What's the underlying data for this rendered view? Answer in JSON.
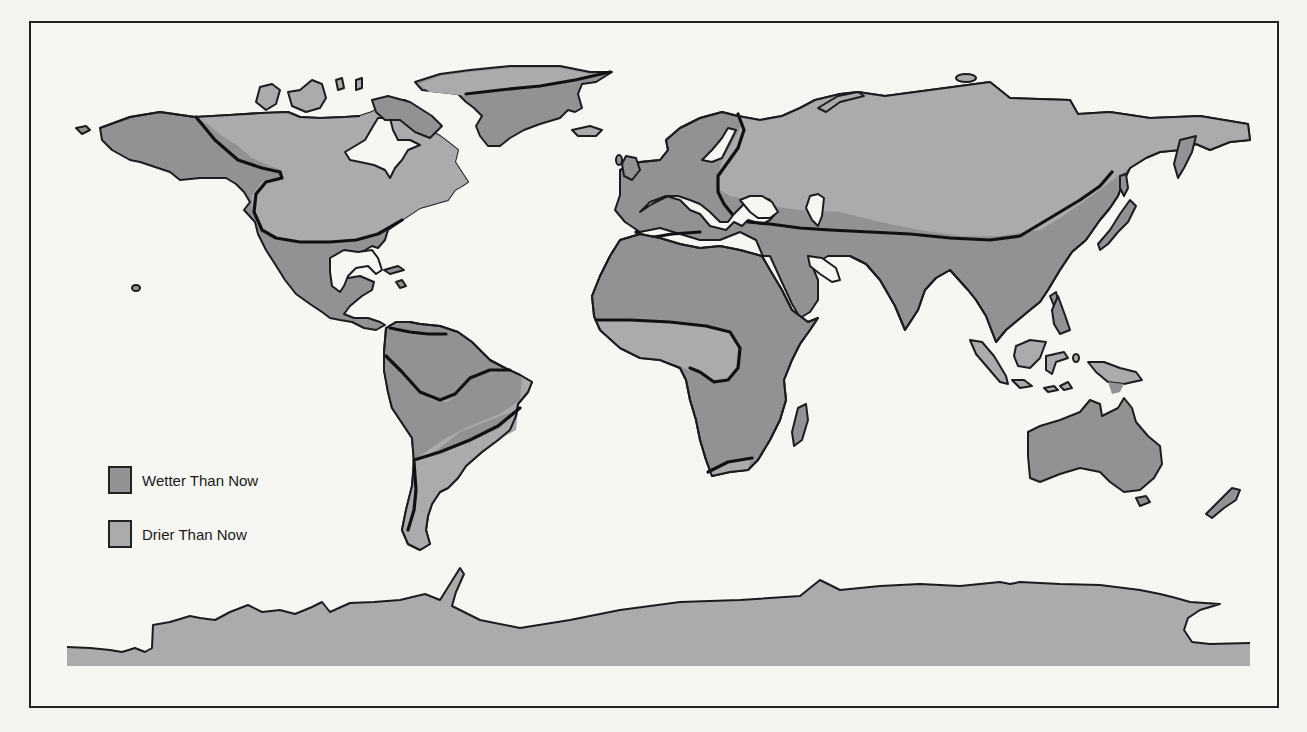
{
  "map": {
    "title": "",
    "subject": "World paleoclimate moisture map (relative to present)",
    "colors": {
      "wetter": "#929292",
      "drier": "#ababab",
      "ocean": "#f6f6f3",
      "boundary": "#111111"
    },
    "legend": {
      "items": [
        {
          "label": "Wetter Than Now",
          "key": "wetter",
          "color": "#929292"
        },
        {
          "label": "Drier Than Now",
          "key": "drier",
          "color": "#ababab"
        }
      ]
    },
    "regions": [
      {
        "name": "Alaska / NW North America",
        "class": "wetter"
      },
      {
        "name": "Canada",
        "class": "drier"
      },
      {
        "name": "Southern USA / Mexico / Central America",
        "class": "wetter"
      },
      {
        "name": "Greenland (north strip)",
        "class": "drier"
      },
      {
        "name": "Greenland (main body)",
        "class": "wetter"
      },
      {
        "name": "Northern South America",
        "class": "wetter"
      },
      {
        "name": "Central Brazil",
        "class": "drier"
      },
      {
        "name": "Central South America",
        "class": "wetter"
      },
      {
        "name": "Southern South America",
        "class": "drier"
      },
      {
        "name": "Western Europe / Scandinavia",
        "class": "wetter"
      },
      {
        "name": "Siberia / Northern Eurasia",
        "class": "drier"
      },
      {
        "name": "North Africa / Sahara",
        "class": "wetter"
      },
      {
        "name": "West Africa / Congo bulge",
        "class": "drier"
      },
      {
        "name": "East & Southern Africa",
        "class": "wetter"
      },
      {
        "name": "Southern tip of Africa",
        "class": "drier"
      },
      {
        "name": "Middle East / South & East Asia",
        "class": "wetter"
      },
      {
        "name": "Borneo / Sumatra",
        "class": "drier"
      },
      {
        "name": "Australia",
        "class": "wetter"
      },
      {
        "name": "Antarctica",
        "class": "drier"
      }
    ]
  }
}
